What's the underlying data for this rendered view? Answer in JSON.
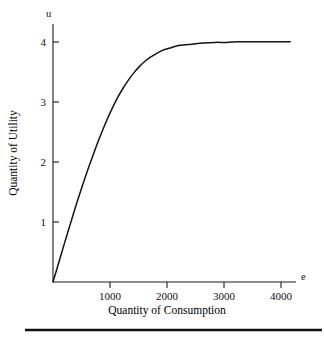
{
  "chart_data": {
    "type": "line",
    "title": "",
    "subtitle": "",
    "xlabel": "Quantity of Consumption",
    "ylabel": "Quantity of Utility",
    "x_axis_variable": "e",
    "y_axis_variable": "u",
    "xlim": [
      0,
      4200
    ],
    "ylim": [
      0,
      4.35
    ],
    "xticks": [
      1000,
      2000,
      3000,
      4000
    ],
    "xtick_labels": [
      "1000",
      "2000",
      "3000",
      "4000"
    ],
    "yticks": [
      1,
      2,
      3,
      4
    ],
    "ytick_labels": [
      "1",
      "2",
      "3",
      "4"
    ],
    "grid": false,
    "legend": false,
    "legend_position": "none",
    "series": [
      {
        "name": "Utility curve",
        "color": "#141414",
        "x": [
          0,
          100,
          200,
          300,
          400,
          500,
          600,
          700,
          800,
          900,
          1000,
          1100,
          1200,
          1300,
          1400,
          1500,
          1600,
          1700,
          1800,
          1900,
          2000,
          2200,
          2400,
          2600,
          2800,
          3000,
          3200,
          3400,
          3600,
          3800,
          4000,
          4100
        ],
        "y": [
          0,
          0.33,
          0.66,
          0.98,
          1.3,
          1.6,
          1.89,
          2.16,
          2.42,
          2.66,
          2.88,
          3.08,
          3.25,
          3.4,
          3.53,
          3.64,
          3.73,
          3.8,
          3.86,
          3.91,
          3.94,
          3.99,
          4.01,
          4.03,
          4.04,
          4.04,
          4.05,
          4.05,
          4.05,
          4.05,
          4.05,
          4.05
        ]
      }
    ],
    "annotations": []
  },
  "figure": {
    "axis_variable_x": "e",
    "axis_variable_y": "u",
    "x_axis_title": "Quantity of Consumption",
    "y_axis_title": "Quantity of Utility",
    "xtick_labels": [
      "1000",
      "2000",
      "3000",
      "4000"
    ],
    "ytick_labels": [
      "1",
      "2",
      "3",
      "4"
    ]
  }
}
